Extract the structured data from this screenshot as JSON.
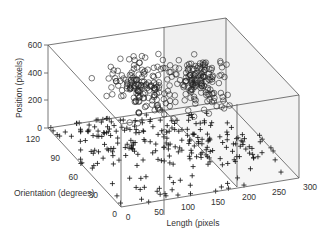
{
  "chart_data": {
    "type": "scatter3d",
    "title": "",
    "xlabel": "Length (pixels",
    "ylabel": "Orientation (degrees)",
    "zlabel": "Position (pixels)",
    "xlim": [
      0,
      300
    ],
    "ylim": [
      0,
      120
    ],
    "zlim": [
      0,
      600
    ],
    "xticks": [
      0,
      50,
      100,
      150,
      200,
      250,
      300
    ],
    "yticks": [
      0,
      30,
      60,
      90,
      120
    ],
    "zticks": [
      0,
      200,
      400,
      600
    ],
    "box": true,
    "grid": false,
    "series": [
      {
        "name": "ground (+)",
        "marker": "+",
        "color": "#000000",
        "description": "points lying on the Position=0 floor, spread over length 0-300 and orientation 0-120, concentrated along a diagonal band",
        "count": 260,
        "z": 0
      },
      {
        "name": "elevated (o)",
        "marker": "o",
        "color": "#333333",
        "description": "two dense clusters raised at Position ~300-600",
        "clusters": [
          {
            "length_center": 110,
            "orientation_center": 80,
            "position_center": 420,
            "count": 150
          },
          {
            "length_center": 200,
            "orientation_center": 70,
            "position_center": 430,
            "count": 150
          }
        ]
      }
    ]
  },
  "axes": {
    "z_label": "Position (pixels)",
    "y_label": "Orientation (degrees)",
    "x_label": "Length (pixels",
    "z_ticks": [
      "0",
      "200",
      "400",
      "600"
    ],
    "y_ticks": [
      "120",
      "90",
      "60",
      "30",
      "0"
    ],
    "x_ticks": [
      "0",
      "50",
      "100",
      "150",
      "200",
      "250",
      "300"
    ]
  },
  "colors": {
    "axis": "#444444",
    "panel": "#efefef",
    "text": "#333333",
    "marker": "#111111"
  }
}
